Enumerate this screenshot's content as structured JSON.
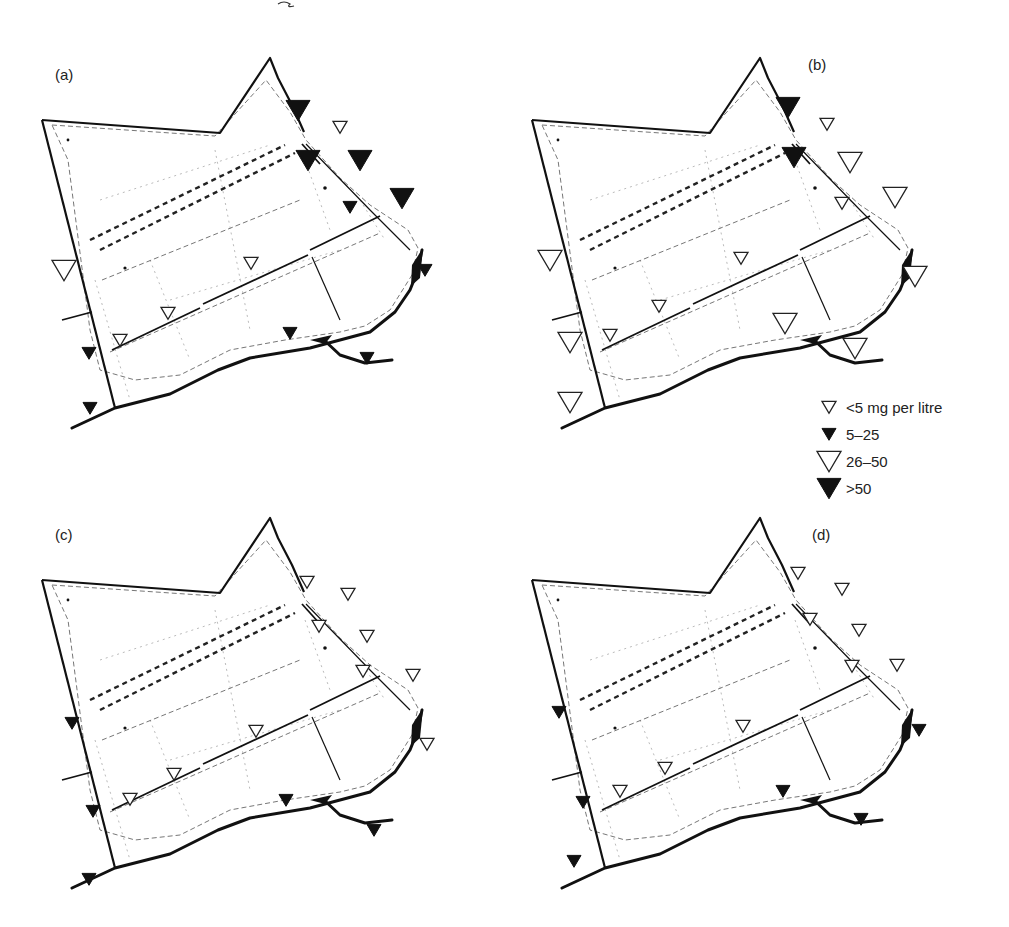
{
  "figure": {
    "top_mark": "~",
    "panels": [
      {
        "id": "a",
        "label": "(a)",
        "origin": [
          40,
          50
        ],
        "label_pos": [
          15,
          30
        ],
        "markers": [
          {
            "x": 258,
            "y": 60,
            "class": ">50"
          },
          {
            "x": 300,
            "y": 77,
            "class": "<5"
          },
          {
            "x": 268,
            "y": 110,
            "class": ">50"
          },
          {
            "x": 320,
            "y": 110,
            "class": ">50"
          },
          {
            "x": 362,
            "y": 148,
            "class": ">50"
          },
          {
            "x": 310,
            "y": 157,
            "class": "5-25"
          },
          {
            "x": 24,
            "y": 220,
            "class": "26-50"
          },
          {
            "x": 211,
            "y": 213,
            "class": "<5"
          },
          {
            "x": 385,
            "y": 220,
            "class": "5-25"
          },
          {
            "x": 128,
            "y": 263,
            "class": "<5"
          },
          {
            "x": 80,
            "y": 290,
            "class": "<5"
          },
          {
            "x": 250,
            "y": 283,
            "class": "5-25"
          },
          {
            "x": 49,
            "y": 303,
            "class": "5-25"
          },
          {
            "x": 327,
            "y": 308,
            "class": "5-25"
          },
          {
            "x": 50,
            "y": 358,
            "class": "5-25"
          }
        ]
      },
      {
        "id": "b",
        "label": "(b)",
        "origin": [
          530,
          50
        ],
        "label_pos": [
          278,
          20
        ],
        "markers": [
          {
            "x": 258,
            "y": 57,
            "class": ">50"
          },
          {
            "x": 297,
            "y": 74,
            "class": "<5"
          },
          {
            "x": 264,
            "y": 107,
            "class": ">50"
          },
          {
            "x": 320,
            "y": 112,
            "class": "26-50"
          },
          {
            "x": 365,
            "y": 147,
            "class": "26-50"
          },
          {
            "x": 312,
            "y": 153,
            "class": "<5"
          },
          {
            "x": 20,
            "y": 210,
            "class": "26-50"
          },
          {
            "x": 385,
            "y": 226,
            "class": "26-50"
          },
          {
            "x": 211,
            "y": 208,
            "class": "<5"
          },
          {
            "x": 129,
            "y": 256,
            "class": "<5"
          },
          {
            "x": 80,
            "y": 285,
            "class": "<5"
          },
          {
            "x": 255,
            "y": 273,
            "class": "26-50"
          },
          {
            "x": 40,
            "y": 292,
            "class": "26-50"
          },
          {
            "x": 325,
            "y": 298,
            "class": "26-50"
          },
          {
            "x": 40,
            "y": 352,
            "class": "26-50"
          }
        ]
      },
      {
        "id": "c",
        "label": "(c)",
        "origin": [
          40,
          510
        ],
        "label_pos": [
          15,
          30
        ],
        "markers": [
          {
            "x": 267,
            "y": 72,
            "class": "<5"
          },
          {
            "x": 308,
            "y": 84,
            "class": "<5"
          },
          {
            "x": 279,
            "y": 116,
            "class": "<5"
          },
          {
            "x": 327,
            "y": 126,
            "class": "<5"
          },
          {
            "x": 373,
            "y": 165,
            "class": "<5"
          },
          {
            "x": 323,
            "y": 161,
            "class": "<5"
          },
          {
            "x": 32,
            "y": 213,
            "class": "5-25"
          },
          {
            "x": 216,
            "y": 221,
            "class": "<5"
          },
          {
            "x": 387,
            "y": 234,
            "class": "<5"
          },
          {
            "x": 134,
            "y": 264,
            "class": "<5"
          },
          {
            "x": 90,
            "y": 289,
            "class": "<5"
          },
          {
            "x": 246,
            "y": 290,
            "class": "5-25"
          },
          {
            "x": 53,
            "y": 301,
            "class": "5-25"
          },
          {
            "x": 334,
            "y": 320,
            "class": "5-25"
          },
          {
            "x": 49,
            "y": 369,
            "class": "5-25"
          }
        ]
      },
      {
        "id": "d",
        "label": "(d)",
        "origin": [
          530,
          510
        ],
        "label_pos": [
          282,
          30
        ],
        "markers": [
          {
            "x": 268,
            "y": 63,
            "class": "<5"
          },
          {
            "x": 312,
            "y": 79,
            "class": "<5"
          },
          {
            "x": 280,
            "y": 109,
            "class": "<5"
          },
          {
            "x": 329,
            "y": 120,
            "class": "<5"
          },
          {
            "x": 367,
            "y": 155,
            "class": "<5"
          },
          {
            "x": 322,
            "y": 156,
            "class": "<5"
          },
          {
            "x": 29,
            "y": 202,
            "class": "5-25"
          },
          {
            "x": 213,
            "y": 216,
            "class": "<5"
          },
          {
            "x": 389,
            "y": 220,
            "class": "5-25"
          },
          {
            "x": 135,
            "y": 258,
            "class": "<5"
          },
          {
            "x": 90,
            "y": 281,
            "class": "<5"
          },
          {
            "x": 253,
            "y": 281,
            "class": "5-25"
          },
          {
            "x": 53,
            "y": 292,
            "class": "5-25"
          },
          {
            "x": 331,
            "y": 309,
            "class": "5-25"
          },
          {
            "x": 44,
            "y": 351,
            "class": "5-25"
          }
        ]
      }
    ]
  },
  "legend": {
    "items": [
      {
        "label": "<5 mg per litre",
        "class": "<5"
      },
      {
        "label": "5–25",
        "class": "5-25"
      },
      {
        "label": "26–50",
        "class": "26-50"
      },
      {
        "label": ">50",
        "class": ">50"
      }
    ]
  },
  "marker_styles": {
    "<5": {
      "size": 7,
      "filled": false
    },
    "5-25": {
      "size": 7,
      "filled": true
    },
    "26-50": {
      "size": 12,
      "filled": false
    },
    ">50": {
      "size": 12,
      "filled": true
    }
  }
}
